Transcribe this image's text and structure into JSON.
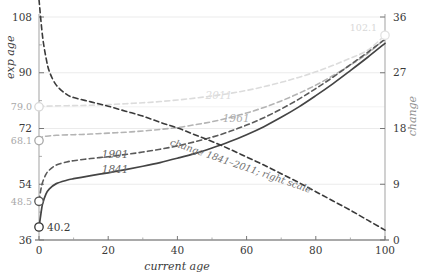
{
  "chart_data": {
    "type": "line",
    "title": "",
    "xlabel": "current age",
    "ylabel": "exp age",
    "y2label": "change",
    "xlim": [
      0,
      100
    ],
    "ylim": [
      36,
      108
    ],
    "y2lim": [
      0,
      36
    ],
    "grid": true,
    "legend_position": "inline-annotations",
    "xticks": [
      "0",
      "20",
      "40",
      "60",
      "80",
      "100"
    ],
    "xtick_values": [
      0,
      20,
      40,
      60,
      80,
      100
    ],
    "yticks": [
      "36",
      "54",
      "72",
      "90",
      "108"
    ],
    "ytick_values": [
      36,
      54,
      72,
      90,
      108
    ],
    "y2ticks": [
      "0",
      "9",
      "18",
      "27",
      "36"
    ],
    "y2tick_values": [
      0,
      9,
      18,
      27,
      36
    ],
    "marker_labels": [
      {
        "label": "108",
        "value": 108,
        "kind": "ytick"
      },
      {
        "label": "90",
        "value": 90,
        "kind": "ytick"
      },
      {
        "label": "79.0",
        "value": 79.0,
        "kind": "marker",
        "color": "#d8d8d8",
        "series": "2011"
      },
      {
        "label": "72",
        "value": 72,
        "kind": "ytick"
      },
      {
        "label": "68.1",
        "value": 68.1,
        "kind": "marker",
        "color": "#a8a8a8",
        "series": "1961"
      },
      {
        "label": "54",
        "value": 54,
        "kind": "ytick"
      },
      {
        "label": "48.5",
        "value": 48.5,
        "kind": "marker",
        "color": "#555555",
        "series": "1901"
      },
      {
        "label": "40.2",
        "value": 40.2,
        "kind": "marker",
        "color": "#333333",
        "series": "1841"
      },
      {
        "label": "36",
        "value": 36,
        "kind": "ytick"
      },
      {
        "label": "102.1",
        "value": 102.1,
        "kind": "marker",
        "color": "#e2e2e2",
        "series": "endpoint"
      }
    ],
    "annotations": [
      {
        "text": "change 1841–2011; right scale",
        "x": 58,
        "y": 11.5,
        "axis": "right",
        "rotation": 19,
        "color": "#6e6e6e"
      }
    ],
    "series": [
      {
        "name": "2011",
        "label": "2011",
        "color": "#dcdcdc",
        "style": "dashed",
        "axis": "left",
        "label_x": 52,
        "label_y": 81.6,
        "x": [
          0,
          1,
          2,
          5,
          10,
          15,
          20,
          25,
          30,
          35,
          40,
          45,
          50,
          55,
          60,
          65,
          70,
          75,
          80,
          85,
          90,
          95,
          100
        ],
        "y": [
          79.0,
          79.2,
          79.2,
          79.3,
          79.4,
          79.5,
          79.7,
          80.0,
          80.3,
          80.7,
          81.2,
          81.8,
          82.5,
          83.3,
          84.3,
          85.5,
          86.9,
          88.5,
          90.3,
          92.4,
          94.7,
          97.3,
          102.1
        ]
      },
      {
        "name": "1961",
        "label": "1961",
        "color": "#b4b4b4",
        "style": "dashed",
        "axis": "left",
        "label_x": 57,
        "label_y": 74.2,
        "x": [
          0,
          1,
          2,
          5,
          10,
          15,
          20,
          25,
          30,
          35,
          40,
          45,
          50,
          55,
          60,
          65,
          70,
          75,
          80,
          85,
          90,
          95,
          100
        ],
        "y": [
          68.1,
          69.3,
          69.5,
          69.8,
          70.0,
          70.2,
          70.5,
          70.8,
          71.2,
          71.7,
          72.3,
          73.2,
          74.2,
          75.5,
          77.0,
          78.8,
          80.9,
          83.3,
          86.0,
          89.1,
          92.5,
          96.2,
          101.0
        ]
      },
      {
        "name": "1901",
        "label": "1901",
        "color": "#5a5a5a",
        "style": "dashed",
        "axis": "left",
        "label_x": 22,
        "label_y": 62.5,
        "x": [
          0,
          0.5,
          1,
          2,
          3,
          5,
          8,
          10,
          15,
          20,
          25,
          30,
          35,
          40,
          45,
          50,
          55,
          60,
          65,
          70,
          75,
          80,
          85,
          90,
          95,
          100
        ],
        "y": [
          48.5,
          52.0,
          54.5,
          57.2,
          58.6,
          60.2,
          61.2,
          61.6,
          62.3,
          62.9,
          63.6,
          64.4,
          65.3,
          66.4,
          67.7,
          69.2,
          71.0,
          73.1,
          75.5,
          78.3,
          81.4,
          84.9,
          88.6,
          92.6,
          96.6,
          100.8
        ]
      },
      {
        "name": "1841",
        "label": "1841",
        "color": "#444444",
        "style": "solid",
        "axis": "left",
        "label_x": 22,
        "label_y": 57.6,
        "x": [
          0,
          0.5,
          1,
          2,
          3,
          5,
          8,
          10,
          15,
          20,
          25,
          30,
          35,
          40,
          45,
          50,
          55,
          60,
          65,
          70,
          75,
          80,
          85,
          90,
          95,
          100
        ],
        "y": [
          40.2,
          44.0,
          47.5,
          50.8,
          52.5,
          54.2,
          55.3,
          55.8,
          56.8,
          57.7,
          58.7,
          59.8,
          61.0,
          62.4,
          63.9,
          65.7,
          67.7,
          70.0,
          72.6,
          75.6,
          78.9,
          82.6,
          86.5,
          90.7,
          95.0,
          99.5
        ]
      },
      {
        "name": "change 1841-2011",
        "label": "change 1841–2011; right scale",
        "color": "#3a3a3a",
        "style": "dashed",
        "axis": "right",
        "x": [
          0,
          1,
          2,
          3,
          5,
          8,
          10,
          15,
          20,
          25,
          30,
          35,
          40,
          45,
          50,
          55,
          60,
          65,
          70,
          75,
          80,
          85,
          90,
          95,
          100
        ],
        "y": [
          38.8,
          33.0,
          29.5,
          27.2,
          25.0,
          23.5,
          23.0,
          22.3,
          21.6,
          20.8,
          20.0,
          19.0,
          18.1,
          17.0,
          15.9,
          14.7,
          13.4,
          12.1,
          10.7,
          9.3,
          7.8,
          6.3,
          4.8,
          3.2,
          1.6
        ]
      }
    ]
  }
}
